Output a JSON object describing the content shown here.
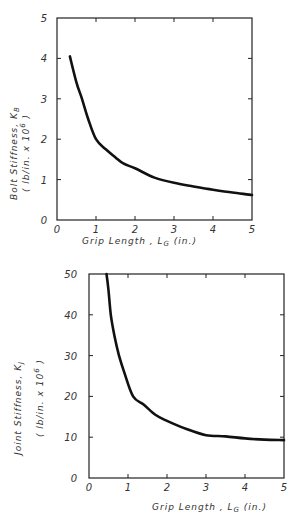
{
  "chart_data": [
    {
      "type": "line",
      "title": "",
      "xlabel": "Grip Length, L_G (in.)",
      "ylabel": "Bolt Stiffness, K_B (lb/in. x 10^6)",
      "ylabel_line1": "Bolt Stiffness, K",
      "ylabel_sub": "B",
      "ylabel_line2": "( lb/in. x 10",
      "ylabel_sup": "6",
      "ylabel_close": " )",
      "xlabel_main": "Grip Length , L",
      "xlabel_sub": "G",
      "xlabel_unit": " (in.)",
      "xlim": [
        0,
        5
      ],
      "ylim": [
        0,
        5
      ],
      "xticks": [
        "0",
        "1",
        "2",
        "3",
        "4",
        "5"
      ],
      "yticks": [
        "0",
        "1",
        "2",
        "3",
        "4",
        "5"
      ],
      "grid": false,
      "series": [
        {
          "name": "Bolt Stiffness",
          "x": [
            0.33,
            0.5,
            0.64,
            0.8,
            1.0,
            1.25,
            1.5,
            1.7,
            2.0,
            2.5,
            3.0,
            3.5,
            4.0,
            4.5,
            5.0
          ],
          "y": [
            4.05,
            3.4,
            3.0,
            2.5,
            2.0,
            1.75,
            1.55,
            1.4,
            1.28,
            1.05,
            0.92,
            0.83,
            0.75,
            0.68,
            0.62
          ]
        }
      ]
    },
    {
      "type": "line",
      "title": "",
      "xlabel": "Grip Length, L_G (in.)",
      "ylabel": "Joint Stiffness, K_J (lb/in. x 10^6)",
      "ylabel_line1": "Joint Stiffness, K",
      "ylabel_sub": "J",
      "ylabel_line2": "( lb/in. x 10",
      "ylabel_sup": "6",
      "ylabel_close": " )",
      "xlabel_main": "Grip Length , L",
      "xlabel_sub": "G",
      "xlabel_unit": " (in.)",
      "xlim": [
        0,
        5
      ],
      "ylim": [
        0,
        50
      ],
      "xticks": [
        "0",
        "1",
        "2",
        "3",
        "4",
        "5"
      ],
      "yticks": [
        "0",
        "10",
        "20",
        "30",
        "40",
        "50"
      ],
      "grid": false,
      "series": [
        {
          "name": "Joint Stiffness",
          "x": [
            0.45,
            0.5,
            0.56,
            0.65,
            0.77,
            0.9,
            1.13,
            1.4,
            1.7,
            2.0,
            2.5,
            3.0,
            3.5,
            4.0,
            4.5,
            5.0
          ],
          "y": [
            50,
            46,
            40,
            35,
            30,
            26,
            20,
            18,
            15.5,
            14,
            12,
            10.5,
            10.2,
            9.7,
            9.4,
            9.3
          ]
        }
      ]
    }
  ]
}
